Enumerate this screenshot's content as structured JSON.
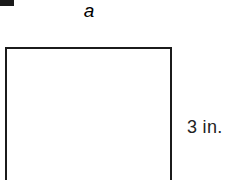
{
  "figure": {
    "type": "geometry-diagram",
    "background_color": "#ffffff",
    "stroke_color": "#1b1b1b",
    "text_color": "#222222",
    "artifact_color": "#1a1a1a",
    "shape": {
      "name": "rectangle",
      "bottom_edge_cropped": true
    },
    "labels": {
      "width": "a",
      "height": "3 in."
    }
  },
  "chart_data": {
    "type": "diagram",
    "title": "",
    "shape": "rectangle",
    "annotations": [
      {
        "name": "width-label",
        "text": "a",
        "side": "top",
        "italic": true
      },
      {
        "name": "height-label",
        "text": "3 in.",
        "side": "right",
        "italic": false
      }
    ],
    "known_values": [
      {
        "dimension": "height",
        "value": 3,
        "unit": "in."
      }
    ],
    "unknown_values": [
      {
        "dimension": "width",
        "symbol": "a"
      }
    ]
  }
}
